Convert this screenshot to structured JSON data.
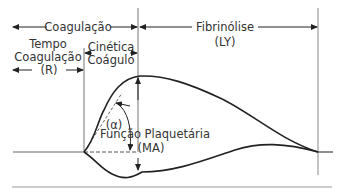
{
  "diagram": {
    "type": "thromboelastography-trace",
    "labels": {
      "coagulation": "Coagulação",
      "fibrinolysis_title": "Fibrinólise",
      "fibrinolysis_abbr": "(LY)",
      "clotting_time_line1": "Tempo",
      "clotting_time_line2": "Coagulação",
      "clotting_time_abbr": "(R)",
      "clot_kinetics_line1": "Cinética",
      "clot_kinetics_line2": "Coágulo",
      "alpha_angle": "(α)",
      "platelet_function": "Função Plaquetária",
      "platelet_function_abbr": "(MA)"
    },
    "colors": {
      "line": "#222222",
      "guide": "#888888",
      "text": "#333333"
    }
  }
}
